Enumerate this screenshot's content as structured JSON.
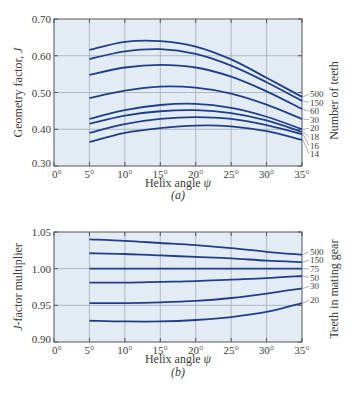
{
  "chart_data": [
    {
      "type": "line",
      "panel_label": "(a)",
      "title": "",
      "xlabel": "Helix angle ψ",
      "ylabel": "Geometry factor, J",
      "right_label": "Number of teeth",
      "xlim": [
        0,
        35
      ],
      "ylim": [
        0.3,
        0.7
      ],
      "grid": true,
      "x_ticks": [
        "0°",
        "5°",
        "10°",
        "15°",
        "20°",
        "25°",
        "30°",
        "35°"
      ],
      "y_ticks": [
        "0.30",
        "0.40",
        "0.50",
        "0.60",
        "0.70"
      ],
      "x": [
        5,
        10,
        15,
        20,
        25,
        30,
        35
      ],
      "series": [
        {
          "name": "500",
          "values": [
            0.616,
            0.638,
            0.64,
            0.625,
            0.59,
            0.54,
            0.488
          ]
        },
        {
          "name": "150",
          "values": [
            0.591,
            0.612,
            0.618,
            0.605,
            0.573,
            0.528,
            0.477
          ]
        },
        {
          "name": "60",
          "values": [
            0.548,
            0.568,
            0.575,
            0.568,
            0.543,
            0.503,
            0.455
          ]
        },
        {
          "name": "30",
          "values": [
            0.485,
            0.505,
            0.516,
            0.513,
            0.497,
            0.467,
            0.428
          ]
        },
        {
          "name": "20",
          "values": [
            0.428,
            0.452,
            0.466,
            0.469,
            0.458,
            0.434,
            0.4
          ]
        },
        {
          "name": "18",
          "values": [
            0.415,
            0.437,
            0.449,
            0.452,
            0.444,
            0.424,
            0.393
          ]
        },
        {
          "name": "16",
          "values": [
            0.39,
            0.414,
            0.428,
            0.433,
            0.428,
            0.411,
            0.387
          ]
        },
        {
          "name": "14",
          "values": [
            0.365,
            0.39,
            0.403,
            0.41,
            0.408,
            0.395,
            0.371
          ]
        }
      ],
      "legend_position": "right-end labels"
    },
    {
      "type": "line",
      "panel_label": "(b)",
      "title": "",
      "xlabel": "Helix angle ψ",
      "ylabel": "J-factor multiplier",
      "right_label": "Teeth in mating gear",
      "xlim": [
        0,
        35
      ],
      "ylim": [
        0.9,
        1.05
      ],
      "grid": true,
      "x_ticks": [
        "0°",
        "5°",
        "10°",
        "15°",
        "20°",
        "25°",
        "30°",
        "35°"
      ],
      "y_ticks": [
        "0.90",
        "0.95",
        "1.00",
        "1.05"
      ],
      "x": [
        5,
        10,
        15,
        20,
        25,
        30,
        35
      ],
      "series": [
        {
          "name": "500",
          "values": [
            1.04,
            1.038,
            1.035,
            1.032,
            1.028,
            1.023,
            1.019
          ]
        },
        {
          "name": "150",
          "values": [
            1.021,
            1.02,
            1.018,
            1.016,
            1.014,
            1.011,
            1.009
          ]
        },
        {
          "name": "75",
          "values": [
            1.0,
            1.0,
            1.0,
            1.0,
            1.0,
            1.0,
            1.0
          ]
        },
        {
          "name": "50",
          "values": [
            0.981,
            0.981,
            0.982,
            0.983,
            0.985,
            0.987,
            0.99
          ]
        },
        {
          "name": "30",
          "values": [
            0.953,
            0.953,
            0.954,
            0.956,
            0.96,
            0.966,
            0.973
          ]
        },
        {
          "name": "20",
          "values": [
            0.929,
            0.928,
            0.928,
            0.93,
            0.934,
            0.941,
            0.953
          ]
        }
      ],
      "legend_position": "right-end labels"
    }
  ],
  "colors": {
    "plot_bg": "#e3ecf5",
    "grid": "#9aa3ab",
    "curve": "#1f3f8a",
    "axis": "#555555",
    "text": "#3a3a3a"
  }
}
